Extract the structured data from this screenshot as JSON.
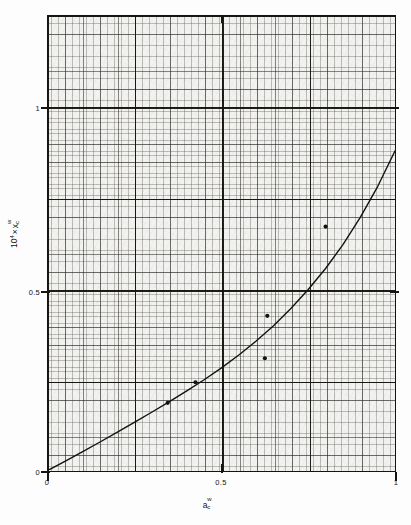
{
  "figure": {
    "background_color": "#fdfdfd",
    "plot_background_color": "#f2f2f0",
    "ink_color": "#15140f"
  },
  "axes": {
    "x": {
      "label_base": "a",
      "label_sup": "w",
      "label_sub": "c",
      "label_plain": "a_c^w",
      "ticks": [
        "0",
        "0.5",
        "1"
      ],
      "tick_values": [
        0,
        0.5,
        1
      ],
      "range": [
        0,
        1
      ]
    },
    "y": {
      "label_prefix": "10",
      "label_prefix_sup": "4",
      "label_times": "×",
      "label_base": "x",
      "label_sup": "w",
      "label_sub": "c",
      "label_plain": "10^4 x x_c^w",
      "ticks": [
        "0",
        "0.5",
        "1"
      ],
      "tick_values": [
        0,
        0.5,
        1
      ],
      "range": [
        0,
        1.985
      ]
    }
  },
  "chart_data": {
    "type": "scatter",
    "title": "",
    "subtitle": "",
    "xlabel": "a_c^w",
    "ylabel": "10^4 x x_c^w",
    "xlim": [
      0,
      1
    ],
    "ylim": [
      0,
      1.985
    ],
    "grid": true,
    "grid_style": "graph-paper, fine 0.01/0.02 minor with major decade rules",
    "legend": "none",
    "annotations": [],
    "series": [
      {
        "name": "measured points",
        "marker": "filled-circle",
        "marker_color": "#121210",
        "points": [
          {
            "x": 0.345,
            "y": 0.295
          },
          {
            "x": 0.425,
            "y": 0.385
          },
          {
            "x": 0.625,
            "y": 0.49
          },
          {
            "x": 0.632,
            "y": 0.675
          },
          {
            "x": 0.8,
            "y": 1.065
          }
        ]
      },
      {
        "name": "fitted curve",
        "marker": "none",
        "line_color": "#121210",
        "line_width": 1.4,
        "points": [
          {
            "x": 0.0,
            "y": 0.0
          },
          {
            "x": 0.05,
            "y": 0.04
          },
          {
            "x": 0.1,
            "y": 0.082
          },
          {
            "x": 0.15,
            "y": 0.124
          },
          {
            "x": 0.2,
            "y": 0.167
          },
          {
            "x": 0.25,
            "y": 0.211
          },
          {
            "x": 0.3,
            "y": 0.255
          },
          {
            "x": 0.35,
            "y": 0.3
          },
          {
            "x": 0.4,
            "y": 0.347
          },
          {
            "x": 0.45,
            "y": 0.396
          },
          {
            "x": 0.5,
            "y": 0.448
          },
          {
            "x": 0.55,
            "y": 0.504
          },
          {
            "x": 0.6,
            "y": 0.565
          },
          {
            "x": 0.65,
            "y": 0.632
          },
          {
            "x": 0.7,
            "y": 0.707
          },
          {
            "x": 0.75,
            "y": 0.79
          },
          {
            "x": 0.8,
            "y": 0.882
          },
          {
            "x": 0.85,
            "y": 0.986
          },
          {
            "x": 0.9,
            "y": 1.105
          },
          {
            "x": 0.95,
            "y": 1.24
          },
          {
            "x": 1.0,
            "y": 1.395
          }
        ]
      }
    ]
  }
}
